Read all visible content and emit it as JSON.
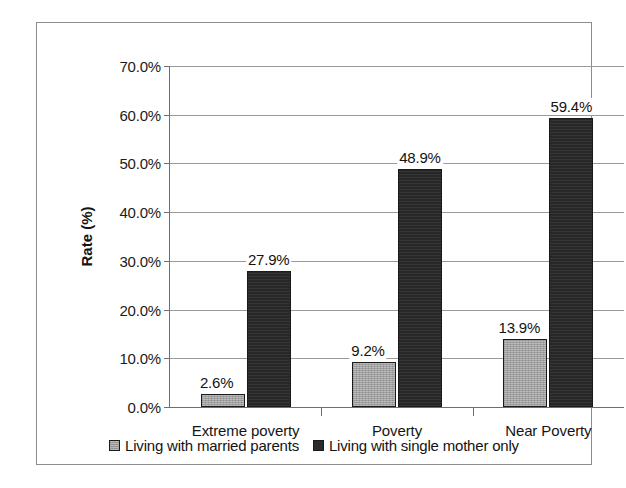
{
  "chart_data": {
    "type": "bar",
    "title": "",
    "xlabel": "",
    "ylabel": "Rate (%)",
    "categories": [
      "Extreme poverty",
      "Poverty",
      "Near Poverty"
    ],
    "series": [
      {
        "name": "Living with married parents",
        "color": "#a0a0a0",
        "values": [
          2.6,
          9.2,
          13.9
        ],
        "labels": [
          "2.6%",
          "9.2%",
          "13.9%"
        ]
      },
      {
        "name": "Living with single mother only",
        "color": "#2b2b2b",
        "values": [
          27.9,
          48.9,
          59.4
        ],
        "labels": [
          "27.9%",
          "48.9%",
          "59.4%"
        ]
      }
    ],
    "ylim": [
      0,
      70
    ],
    "ytick_values": [
      0,
      10,
      20,
      30,
      40,
      50,
      60,
      70
    ],
    "ytick_labels": [
      "0.0%",
      "10.0%",
      "20.0%",
      "30.0%",
      "40.0%",
      "50.0%",
      "60.0%",
      "70.0%"
    ],
    "grid": true,
    "legend_position": "bottom",
    "value_format": "percent"
  },
  "legend": {
    "items": [
      {
        "label": "Living with married parents",
        "swatch": "legend-swatch-married"
      },
      {
        "label": "Living with single mother only",
        "swatch": "legend-swatch-single"
      }
    ]
  }
}
